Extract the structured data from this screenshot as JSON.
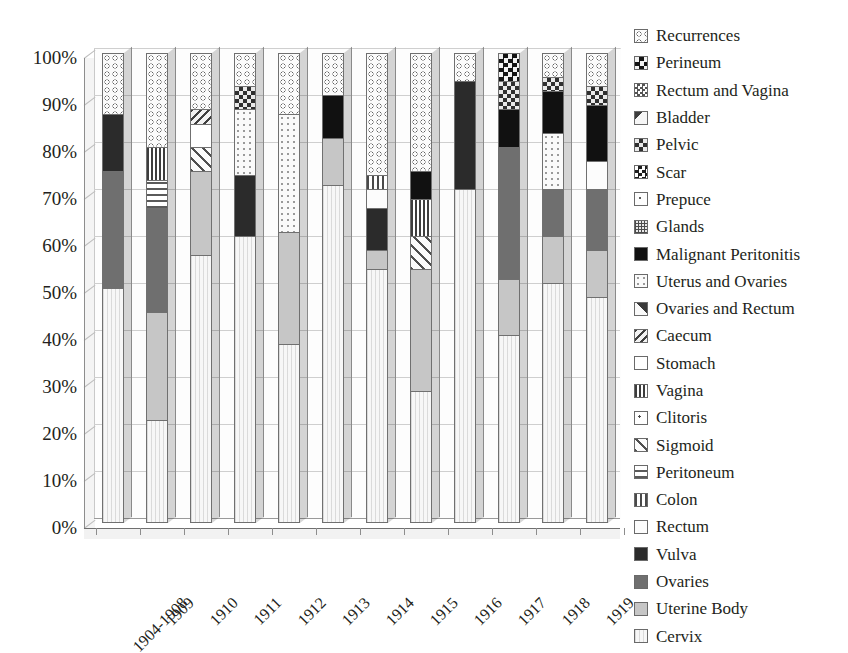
{
  "chart_data": {
    "type": "bar",
    "subtype": "stacked-percentage-3d",
    "title": "",
    "xlabel": "",
    "ylabel": "",
    "ylim": [
      0,
      100
    ],
    "ytick_labels": [
      "100%",
      "90%",
      "80%",
      "70%",
      "60%",
      "50%",
      "40%",
      "30%",
      "20%",
      "10%",
      "0%"
    ],
    "ytick_values": [
      100,
      90,
      80,
      70,
      60,
      50,
      40,
      30,
      20,
      10,
      0
    ],
    "grid": true,
    "legend_position": "right",
    "categories": [
      "1904-1908",
      "1909",
      "1910",
      "1911",
      "1912",
      "1913",
      "1914",
      "1915",
      "1916",
      "1917",
      "1918",
      "1919"
    ],
    "legend_order_top_to_bottom": [
      "Recurrences",
      "Perineum",
      "Rectum and Vagina",
      "Bladder",
      "Pelvic",
      "Scar",
      "Prepuce",
      "Glands",
      "Malignant Peritonitis",
      "Uterus and Ovaries",
      "Ovaries and Rectum",
      "Caecum",
      "Stomach",
      "Vagina",
      "Clitoris",
      "Sigmoid",
      "Peritoneum",
      "Colon",
      "Rectum",
      "Vulva",
      "Ovaries",
      "Uterine Body",
      "Cervix"
    ],
    "legend_icons": [
      "swatch-recurrences",
      "swatch-perineum",
      "swatch-rectum-and-vagina",
      "swatch-bladder",
      "swatch-pelvic",
      "swatch-scar",
      "swatch-prepuce",
      "swatch-glands",
      "swatch-malignant-peritonitis",
      "swatch-uterus-and-ovaries",
      "swatch-ovaries-and-rectum",
      "swatch-caecum",
      "swatch-stomach",
      "swatch-vagina",
      "swatch-clitoris",
      "swatch-sigmoid",
      "swatch-peritoneum",
      "swatch-colon",
      "swatch-rectum",
      "swatch-vulva",
      "swatch-ovaries",
      "swatch-uterine-body",
      "swatch-cervix"
    ],
    "series": [
      {
        "name": "Cervix",
        "values": [
          50,
          22,
          57,
          61,
          38,
          72,
          54,
          28,
          71,
          40,
          51,
          48
        ]
      },
      {
        "name": "Uterine Body",
        "values": [
          0,
          23,
          18,
          0,
          24,
          10,
          4,
          26,
          0,
          12,
          10,
          10
        ]
      },
      {
        "name": "Ovaries",
        "values": [
          25,
          22,
          0,
          0,
          0,
          0,
          0,
          0,
          0,
          28,
          10,
          13
        ]
      },
      {
        "name": "Vulva",
        "values": [
          12,
          0,
          0,
          13,
          0,
          0,
          9,
          0,
          23,
          0,
          0,
          0
        ]
      },
      {
        "name": "Rectum",
        "values": [
          0,
          0,
          0,
          0,
          0,
          0,
          4,
          0,
          0,
          0,
          0,
          6
        ]
      },
      {
        "name": "Colon",
        "values": [
          0,
          0,
          0,
          0,
          0,
          0,
          3,
          0,
          0,
          0,
          0,
          0
        ]
      },
      {
        "name": "Peritoneum",
        "values": [
          0,
          6,
          0,
          0,
          0,
          0,
          0,
          0,
          0,
          0,
          0,
          0
        ]
      },
      {
        "name": "Sigmoid",
        "values": [
          0,
          0,
          5,
          0,
          0,
          0,
          0,
          7,
          0,
          0,
          0,
          0
        ]
      },
      {
        "name": "Clitoris",
        "values": [
          0,
          0,
          0,
          0,
          0,
          0,
          0,
          0,
          0,
          0,
          0,
          0
        ]
      },
      {
        "name": "Vagina",
        "values": [
          0,
          7,
          0,
          0,
          0,
          0,
          0,
          8,
          0,
          0,
          0,
          0
        ]
      },
      {
        "name": "Stomach",
        "values": [
          0,
          0,
          5,
          0,
          0,
          0,
          0,
          0,
          0,
          0,
          0,
          0
        ]
      },
      {
        "name": "Caecum",
        "values": [
          0,
          0,
          3,
          0,
          0,
          0,
          0,
          0,
          0,
          0,
          0,
          0
        ]
      },
      {
        "name": "Ovaries and Rectum",
        "values": [
          0,
          0,
          0,
          0,
          0,
          0,
          0,
          0,
          0,
          0,
          0,
          0
        ]
      },
      {
        "name": "Uterus and Ovaries",
        "values": [
          0,
          0,
          0,
          14,
          25,
          0,
          0,
          0,
          0,
          0,
          12,
          0
        ]
      },
      {
        "name": "Malignant Peritonitis",
        "values": [
          0,
          0,
          0,
          0,
          0,
          9,
          0,
          6,
          0,
          8,
          9,
          12
        ]
      },
      {
        "name": "Glands",
        "values": [
          0,
          0,
          0,
          0,
          0,
          0,
          0,
          0,
          0,
          0,
          0,
          0
        ]
      },
      {
        "name": "Prepuce",
        "values": [
          0,
          0,
          0,
          0,
          0,
          0,
          0,
          0,
          0,
          0,
          0,
          0
        ]
      },
      {
        "name": "Scar",
        "values": [
          0,
          0,
          0,
          0,
          0,
          0,
          0,
          0,
          0,
          0,
          0,
          0
        ]
      },
      {
        "name": "Pelvic",
        "values": [
          0,
          0,
          0,
          5,
          0,
          0,
          0,
          0,
          0,
          6,
          3,
          4
        ]
      },
      {
        "name": "Bladder",
        "values": [
          0,
          0,
          0,
          0,
          0,
          0,
          0,
          0,
          0,
          0,
          0,
          0
        ]
      },
      {
        "name": "Rectum and Vagina",
        "values": [
          0,
          0,
          0,
          0,
          0,
          0,
          0,
          0,
          0,
          0,
          0,
          0
        ]
      },
      {
        "name": "Perineum",
        "values": [
          0,
          0,
          0,
          0,
          0,
          0,
          0,
          0,
          0,
          6,
          0,
          0
        ]
      },
      {
        "name": "Recurrences",
        "values": [
          13,
          20,
          12,
          7,
          13,
          9,
          26,
          25,
          6,
          0,
          5,
          7
        ]
      }
    ]
  },
  "legend": {
    "items": [
      {
        "label": "Recurrences",
        "pattern": "pat-recurrences"
      },
      {
        "label": "Perineum",
        "pattern": "pat-perineum"
      },
      {
        "label": "Rectum and Vagina",
        "pattern": "pat-rectum-vagina"
      },
      {
        "label": "Bladder",
        "pattern": "pat-bladder"
      },
      {
        "label": "Pelvic",
        "pattern": "pat-pelvic"
      },
      {
        "label": "Scar",
        "pattern": "pat-scar"
      },
      {
        "label": "Prepuce",
        "pattern": "pat-prepuce"
      },
      {
        "label": "Glands",
        "pattern": "pat-glands"
      },
      {
        "label": "Malignant Peritonitis",
        "pattern": "pat-malignant-peritonitis"
      },
      {
        "label": "Uterus and Ovaries",
        "pattern": "pat-uterus-ovaries"
      },
      {
        "label": "Ovaries and Rectum",
        "pattern": "pat-ovaries-rectum"
      },
      {
        "label": "Caecum",
        "pattern": "pat-caecum"
      },
      {
        "label": "Stomach",
        "pattern": "pat-stomach"
      },
      {
        "label": "Vagina",
        "pattern": "pat-vagina"
      },
      {
        "label": "Clitoris",
        "pattern": "pat-clitoris"
      },
      {
        "label": "Sigmoid",
        "pattern": "pat-sigmoid"
      },
      {
        "label": "Peritoneum",
        "pattern": "pat-peritoneum"
      },
      {
        "label": "Colon",
        "pattern": "pat-colon"
      },
      {
        "label": "Rectum",
        "pattern": "pat-rectum"
      },
      {
        "label": "Vulva",
        "pattern": "pat-vulva"
      },
      {
        "label": "Ovaries",
        "pattern": "pat-ovaries"
      },
      {
        "label": "Uterine Body",
        "pattern": "pat-uterine-body"
      },
      {
        "label": "Cervix",
        "pattern": "pat-cervix"
      }
    ]
  },
  "series_pattern_map": {
    "Cervix": "pat-cervix",
    "Uterine Body": "pat-uterine-body",
    "Ovaries": "pat-ovaries",
    "Vulva": "pat-vulva",
    "Rectum": "pat-rectum",
    "Colon": "pat-colon",
    "Peritoneum": "pat-peritoneum",
    "Sigmoid": "pat-sigmoid",
    "Clitoris": "pat-clitoris",
    "Vagina": "pat-vagina",
    "Stomach": "pat-stomach",
    "Caecum": "pat-caecum",
    "Ovaries and Rectum": "pat-ovaries-rectum",
    "Uterus and Ovaries": "pat-uterus-ovaries",
    "Malignant Peritonitis": "pat-malignant-peritonitis",
    "Glands": "pat-glands",
    "Prepuce": "pat-prepuce",
    "Scar": "pat-scar",
    "Pelvic": "pat-pelvic",
    "Bladder": "pat-bladder",
    "Rectum and Vagina": "pat-rectum-vagina",
    "Perineum": "pat-perineum",
    "Recurrences": "pat-recurrences"
  },
  "colors": {
    "background": "#ffffff",
    "text": "#231f20",
    "gridline": "#cfcfcf",
    "axis": "#8d8d8d"
  }
}
